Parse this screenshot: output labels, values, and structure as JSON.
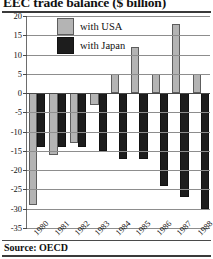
{
  "figure": {
    "title": "EEC trade balance ($ billion)",
    "source_label": "Source: OECD"
  },
  "legend": {
    "position": "top-left-inside",
    "entries": [
      {
        "label": "with USA",
        "color": "#b4b4b4",
        "swatch": "usa-swatch"
      },
      {
        "label": "with Japan",
        "color": "#1d1d1d",
        "swatch": "japan-swatch"
      }
    ]
  },
  "chart_data": {
    "type": "bar",
    "title": "EEC trade balance ($ billion)",
    "subtitle": "",
    "xlabel": "",
    "ylabel": "$ billion",
    "categories": [
      "1980",
      "1981",
      "1982",
      "1983",
      "1984",
      "1985",
      "1986",
      "1987",
      "1988"
    ],
    "series": [
      {
        "name": "with USA",
        "color": "#b4b4b4",
        "values": [
          -29,
          -16,
          -13,
          -3,
          5,
          12,
          5,
          18,
          5
        ]
      },
      {
        "name": "with Japan",
        "color": "#1d1d1d",
        "values": [
          -14,
          -14,
          -14,
          -15,
          -17,
          -17,
          -24,
          -27,
          -30
        ]
      }
    ],
    "ylim": [
      -35,
      20
    ],
    "ytick_step": 5,
    "yticks": [
      20,
      15,
      10,
      5,
      0,
      -5,
      -10,
      -15,
      -20,
      -25,
      -30,
      -35
    ],
    "ytick_labels": [
      "20",
      "15",
      "10",
      "5",
      "0",
      "-5",
      "-10",
      "-15",
      "-20",
      "-25",
      "-30",
      "-35"
    ],
    "grid": true,
    "grid_axis": "y",
    "legend_position": "upper left",
    "x_tick_rotation": -45,
    "annotations": [
      "Source: OECD"
    ]
  }
}
